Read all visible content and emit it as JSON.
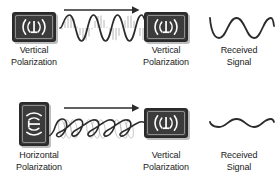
{
  "figure": {
    "stroke_color": "#2b2b2b",
    "device_color": "#3b3b3b",
    "shadow_color": "#bdbdbd"
  },
  "rows": [
    {
      "id": "matched-polarization",
      "transmitter": {
        "icon": "antenna-vertical-icon",
        "orientation": "landscape",
        "caption_line1": "Vertical",
        "caption_line2": "Polarization"
      },
      "propagation": {
        "arrow": "direction-arrow-right",
        "wave_type": "vertical-hatched-sine",
        "amplitude": 13,
        "cycles": 3
      },
      "receiver": {
        "icon": "antenna-vertical-icon",
        "orientation": "landscape",
        "caption_line1": "Vertical",
        "caption_line2": "Polarization"
      },
      "received": {
        "caption_line1": "Received",
        "caption_line2": "Signal",
        "wave_type": "sine",
        "amplitude": 11,
        "cycles": 2
      }
    },
    {
      "id": "mismatched-polarization",
      "transmitter": {
        "icon": "antenna-horizontal-icon",
        "orientation": "portrait",
        "caption_line1": "Horizontal",
        "caption_line2": "Polarization"
      },
      "propagation": {
        "arrow": "direction-arrow-right",
        "wave_type": "helical-corkscrew",
        "amplitude": 10,
        "cycles": 3
      },
      "receiver": {
        "icon": "antenna-vertical-icon",
        "orientation": "landscape",
        "caption_line1": "Vertical",
        "caption_line2": "Polarization"
      },
      "received": {
        "caption_line1": "Received",
        "caption_line2": "Signal",
        "wave_type": "sine-attenuated",
        "amplitude": 4,
        "cycles": 2
      }
    }
  ]
}
